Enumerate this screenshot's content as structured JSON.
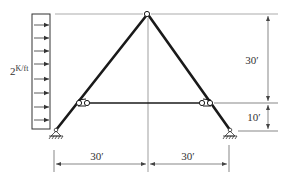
{
  "diagram": {
    "type": "structural-frame",
    "load": {
      "label_main": "2",
      "label_units": "K/ft",
      "direction": "left-to-right",
      "arrow_count": 8
    },
    "dimensions": {
      "vertical_upper": "30′",
      "vertical_lower": "10′",
      "horizontal_left": "30′",
      "horizontal_right": "30′"
    },
    "members": [
      "left-rafter",
      "right-rafter",
      "tie-bar"
    ],
    "supports": [
      "left-pin-support",
      "right-pin-support"
    ],
    "hinges": [
      "apex-hinge",
      "left-tie-hinge",
      "right-tie-hinge"
    ],
    "colors": {
      "member": "#1a1a1a",
      "dimension": "#555555",
      "text": "#333333"
    }
  }
}
